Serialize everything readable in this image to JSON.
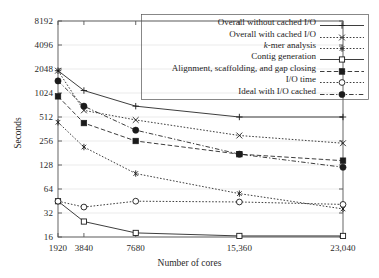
{
  "chart_data": {
    "type": "line",
    "title": "",
    "xlabel": "Number of cores",
    "ylabel": "Seconds",
    "xscale": "linear",
    "yscale": "log2",
    "xlim": [
      1920,
      23040
    ],
    "ylim": [
      16,
      8192
    ],
    "grid": true,
    "grid_axis": "y",
    "legend_position": "top-right",
    "x": [
      1920,
      3840,
      7680,
      15360,
      23040
    ],
    "xtick_labels": [
      "1920",
      "3840",
      "7680",
      "15,360",
      "23,040"
    ],
    "ytick_values": [
      16,
      32,
      64,
      128,
      256,
      512,
      1024,
      2048,
      4096,
      8192
    ],
    "ytick_labels": [
      "16",
      "32",
      "64",
      "128",
      "256",
      "512",
      "1024",
      "2048",
      "4096",
      "8192"
    ],
    "series": [
      {
        "name": "Overall without cached I/O",
        "marker": "plus",
        "linestyle": "solid",
        "values": [
          1950,
          1100,
          700,
          512,
          512
        ]
      },
      {
        "name": "Overall with cached I/O",
        "marker": "cross",
        "linestyle": "dotted",
        "values": [
          1950,
          620,
          470,
          300,
          240
        ]
      },
      {
        "name": "k-mer analysis",
        "marker": "star",
        "linestyle": "dotted",
        "values": [
          440,
          215,
          100,
          56,
          36
        ],
        "label_italic_prefix": "k",
        "label_rest": "-mer analysis"
      },
      {
        "name": "Contig generation",
        "marker": "open-square",
        "linestyle": "solid",
        "values": [
          45,
          25,
          18,
          16.5,
          16.5
        ]
      },
      {
        "name": "Alignment, scaffolding, and gap closing",
        "marker": "filled-square",
        "linestyle": "dashed",
        "values": [
          930,
          430,
          256,
          175,
          145
        ]
      },
      {
        "name": "I/O time",
        "marker": "open-circle",
        "linestyle": "dotted",
        "values": [
          45,
          38,
          45,
          44,
          41
        ]
      },
      {
        "name": "Ideal with I/O cached",
        "marker": "filled-circle",
        "linestyle": "dash-dot",
        "values": [
          1450,
          700,
          350,
          175,
          120
        ]
      }
    ]
  },
  "colors": {
    "ink": "#1b1b1b",
    "axis": "#555555",
    "grid": "#e2e2e2",
    "background": "#ffffff"
  }
}
